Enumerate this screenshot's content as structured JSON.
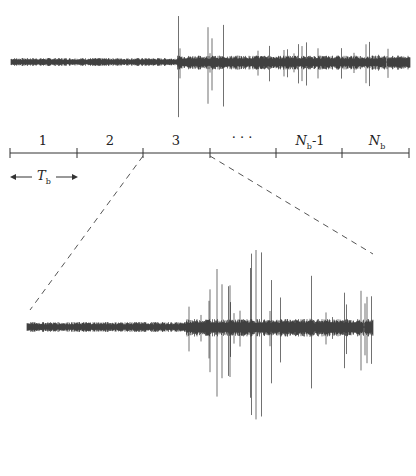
{
  "diagram": {
    "segment_labels": [
      "1",
      "2",
      "3",
      "·",
      "·",
      "·",
      "N_b-1",
      "N_b"
    ],
    "block_labels": {
      "b1": "1",
      "b2": "2",
      "b3": "3",
      "dots": "·  ·  ·",
      "nb1_main": "N",
      "nb1_sub": "b",
      "nb1_suffix": "-1",
      "nb_main": "N",
      "nb_sub": "b"
    },
    "period_label": {
      "main": "T",
      "sub": "b"
    },
    "axis_ticks_x": [
      10,
      77,
      143,
      210,
      276,
      342,
      409
    ],
    "zoom_region": {
      "from_tick": 2,
      "to_tick": 3
    },
    "colors": {
      "signal": "#111111",
      "axis": "#333333",
      "dashed": "#555555"
    }
  }
}
